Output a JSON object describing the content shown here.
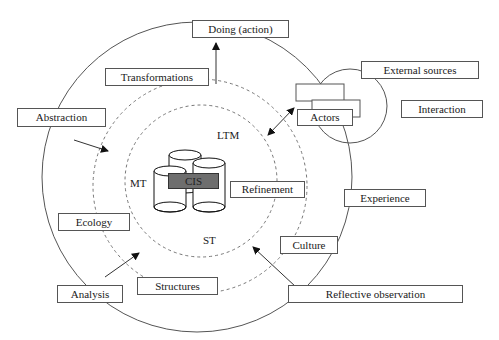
{
  "diagram": {
    "center_label": "CIS",
    "memory_labels": {
      "ltm": "LTM",
      "mt": "MT",
      "st": "ST"
    },
    "boxes": {
      "doing": "Doing (action)",
      "transformations": "Transformations",
      "abstraction": "Abstraction",
      "external_sources": "External sources",
      "actors": "Actors",
      "interaction": "Interaction",
      "refinement": "Refinement",
      "experience": "Experience",
      "ecology": "Ecology",
      "culture": "Culture",
      "analysis": "Analysis",
      "structures": "Structures",
      "reflective_observation": "Reflective observation"
    },
    "colors": {
      "line": "#555555",
      "cis_fill": "#6e6e6e",
      "background": "#ffffff"
    }
  }
}
